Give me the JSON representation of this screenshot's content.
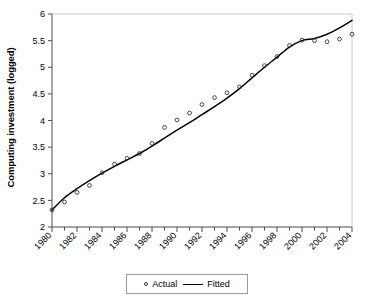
{
  "chart_data": {
    "type": "line",
    "title": "",
    "xlabel": "",
    "ylabel": "Computing investment (logged)",
    "xlim": [
      1980,
      2004
    ],
    "ylim": [
      2,
      6
    ],
    "ytick_step": 0.5,
    "ytick_labels": [
      "2",
      "2.5",
      "3",
      "3.5",
      "4",
      "4.5",
      "5",
      "5.5",
      "6"
    ],
    "ytick_values": [
      2,
      2.5,
      3,
      3.5,
      4,
      4.5,
      5,
      5.5,
      6
    ],
    "xtick_labels": [
      "1980",
      "1982",
      "1984",
      "1986",
      "1988",
      "1990",
      "1992",
      "1994",
      "1996",
      "1998",
      "2000",
      "2002",
      "2004"
    ],
    "xtick_values": [
      1980,
      1982,
      1984,
      1986,
      1988,
      1990,
      1992,
      1994,
      1996,
      1998,
      2000,
      2002,
      2004
    ],
    "xtick_minor_values": [
      1981,
      1983,
      1985,
      1987,
      1989,
      1991,
      1993,
      1995,
      1997,
      1999,
      2001,
      2003
    ],
    "xtick_rotation_deg": -45,
    "grid": false,
    "legend_position": "bottom",
    "x": [
      1980,
      1981,
      1982,
      1983,
      1984,
      1985,
      1986,
      1987,
      1988,
      1989,
      1990,
      1991,
      1992,
      1993,
      1994,
      1995,
      1996,
      1997,
      1998,
      1999,
      2000,
      2001,
      2002,
      2003,
      2004
    ],
    "series": [
      {
        "name": "Actual",
        "marker": "open-circle",
        "line": "none",
        "color": "#333333",
        "values": [
          2.32,
          2.47,
          2.65,
          2.78,
          3.02,
          3.18,
          3.29,
          3.38,
          3.57,
          3.87,
          4.01,
          4.14,
          4.3,
          4.43,
          4.52,
          4.63,
          4.85,
          5.03,
          5.2,
          5.41,
          5.51,
          5.5,
          5.48,
          5.53,
          5.62
        ]
      },
      {
        "name": "Fitted",
        "marker": "none",
        "line": "solid",
        "color": "#000000",
        "values": [
          2.32,
          2.55,
          2.72,
          2.87,
          3.01,
          3.14,
          3.26,
          3.38,
          3.52,
          3.67,
          3.82,
          3.96,
          4.11,
          4.26,
          4.42,
          4.6,
          4.8,
          5.0,
          5.19,
          5.38,
          5.5,
          5.54,
          5.62,
          5.74,
          5.88
        ]
      }
    ]
  },
  "legend": {
    "items": [
      {
        "label": "Actual",
        "marker": "open-circle"
      },
      {
        "label": "Fitted",
        "marker": "line"
      }
    ]
  }
}
